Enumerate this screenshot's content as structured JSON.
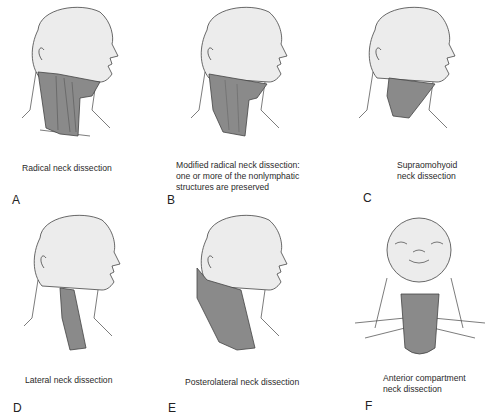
{
  "figure": {
    "panels": [
      {
        "letter": "A",
        "caption_lines": [
          "Radical neck dissection"
        ],
        "view": "lateral",
        "region": "radical"
      },
      {
        "letter": "B",
        "caption_lines": [
          "Modified radical neck dissection:",
          "one or more of the nonlymphatic",
          "structures are preserved"
        ],
        "view": "lateral",
        "region": "modified-radical"
      },
      {
        "letter": "C",
        "caption_lines": [
          "Supraomohyoid",
          "neck dissection"
        ],
        "view": "lateral",
        "region": "supraomohyoid"
      },
      {
        "letter": "D",
        "caption_lines": [
          "Lateral neck dissection"
        ],
        "view": "lateral",
        "region": "lateral"
      },
      {
        "letter": "E",
        "caption_lines": [
          "Posterolateral neck dissection"
        ],
        "view": "lateral",
        "region": "posterolateral"
      },
      {
        "letter": "F",
        "caption_lines": [
          "Anterior compartment",
          "neck dissection"
        ],
        "view": "anterior",
        "region": "anterior-compartment"
      }
    ]
  },
  "colors": {
    "head_fill": "#ececec",
    "outline": "#444444",
    "shaded_region": "#8a8a8a",
    "shaded_dark": "#6e6e6e"
  }
}
